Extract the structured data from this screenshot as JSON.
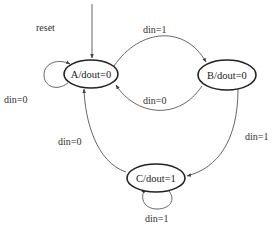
{
  "diagram": {
    "type": "finite-state-machine",
    "colors": {
      "node_stroke": "#222222",
      "edge_stroke": "#555555",
      "text": "#333333",
      "background": "#ffffff"
    },
    "states": [
      {
        "id": "A",
        "label": "A/dout=0"
      },
      {
        "id": "B",
        "label": "B/dout=0"
      },
      {
        "id": "C",
        "label": "C/dout=1"
      }
    ],
    "reset": {
      "label": "reset",
      "target": "A"
    },
    "transitions": [
      {
        "from": "A",
        "to": "A",
        "label": "din=0"
      },
      {
        "from": "A",
        "to": "B",
        "label": "din=1"
      },
      {
        "from": "B",
        "to": "A",
        "label": "din=0"
      },
      {
        "from": "B",
        "to": "C",
        "label": "din=1"
      },
      {
        "from": "C",
        "to": "A",
        "label": "din=0"
      },
      {
        "from": "C",
        "to": "C",
        "label": "din=1"
      }
    ]
  }
}
